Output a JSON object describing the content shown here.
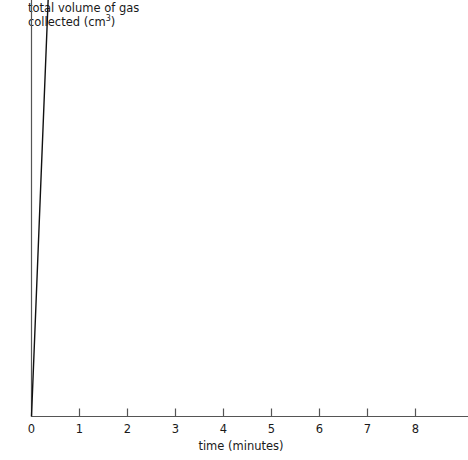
{
  "chart_data": {
    "type": "line",
    "title": "",
    "ylabel": "total volume of gas collected (cm3)",
    "ylabel_line1": "total volume of gas",
    "ylabel_line2_pre": "collected (cm",
    "ylabel_line2_sup": "3",
    "ylabel_line2_post": ")",
    "xlabel": "time (minutes)",
    "x": [
      0,
      1,
      2,
      3,
      4,
      5,
      6,
      7,
      8
    ],
    "values": [
      0,
      25,
      45,
      60,
      69.5,
      75,
      77,
      77,
      78
    ],
    "xlim": [
      0,
      9.2
    ],
    "ylim": [
      0,
      80
    ],
    "xticks": [
      0,
      1,
      2,
      3,
      4,
      5,
      6,
      7,
      8
    ],
    "xtick_labels": [
      "0",
      "1",
      "2",
      "3",
      "4",
      "5",
      "6",
      "7",
      "8"
    ],
    "yticks": [
      10,
      20,
      30,
      40,
      50,
      60,
      70,
      80
    ],
    "ytick_labels": [
      "10",
      "20",
      "30",
      "40",
      "50",
      "60",
      "70",
      "80"
    ],
    "grid": false,
    "legend": null,
    "marker": "filled-circle",
    "marker_color": "#111111",
    "line_color": "#111111",
    "axis_color": "#555555",
    "background": "#ffffff",
    "markers_shown_at_x": [
      1,
      2,
      3,
      4,
      5,
      6,
      7,
      8
    ],
    "annotations": []
  }
}
